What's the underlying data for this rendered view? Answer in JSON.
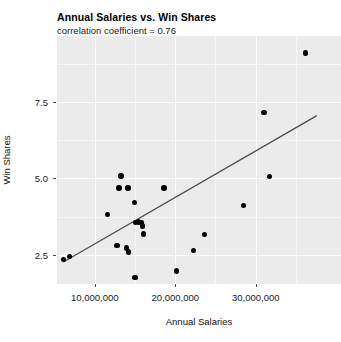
{
  "chart_data": {
    "type": "scatter",
    "title": "Annual Salaries vs. Win Shares",
    "subtitle": "correlation coefficient = 0.76",
    "xlabel": "Annual Salaries",
    "ylabel": "Win Shares",
    "xlim": [
      5300000,
      40600000
    ],
    "ylim": [
      1.55,
      9.65
    ],
    "grid": true,
    "legend": null,
    "xticks": [
      10000000,
      20000000,
      30000000
    ],
    "xtick_labels": [
      "10,000,000",
      "20,000,000",
      "30,000,000"
    ],
    "yticks": [
      2.5,
      5.0,
      7.5
    ],
    "ytick_labels": [
      "2.5",
      "5.0",
      "7.5"
    ],
    "x_minor_ticks": [
      5000000,
      15000000,
      25000000,
      35000000
    ],
    "y_minor_ticks": [
      3.75,
      6.25,
      8.75
    ],
    "point_color": "#000000",
    "panel_color": "#ebebeb",
    "grid_color": "#ffffff",
    "fit_line_color": "#4d4d4d",
    "fit_line": {
      "x_start": 6100000,
      "y_start": 2.27,
      "x_end": 37600000,
      "y_end": 7.05
    },
    "points": [
      {
        "x": 6100000,
        "y": 2.35
      },
      {
        "x": 6850000,
        "y": 2.45
      },
      {
        "x": 11550000,
        "y": 3.82
      },
      {
        "x": 12750000,
        "y": 2.8
      },
      {
        "x": 13900000,
        "y": 2.73
      },
      {
        "x": 13250000,
        "y": 5.08
      },
      {
        "x": 13000000,
        "y": 4.68
      },
      {
        "x": 14100000,
        "y": 4.68
      },
      {
        "x": 14950000,
        "y": 4.22
      },
      {
        "x": 15050000,
        "y": 3.55
      },
      {
        "x": 15450000,
        "y": 3.58
      },
      {
        "x": 15800000,
        "y": 3.56
      },
      {
        "x": 15950000,
        "y": 3.45
      },
      {
        "x": 14200000,
        "y": 2.6
      },
      {
        "x": 16050000,
        "y": 3.18
      },
      {
        "x": 15000000,
        "y": 1.76
      },
      {
        "x": 18600000,
        "y": 4.68
      },
      {
        "x": 20150000,
        "y": 1.98
      },
      {
        "x": 22250000,
        "y": 2.65
      },
      {
        "x": 23600000,
        "y": 3.16
      },
      {
        "x": 28500000,
        "y": 4.11
      },
      {
        "x": 31700000,
        "y": 5.07
      },
      {
        "x": 31050000,
        "y": 7.15
      },
      {
        "x": 36150000,
        "y": 9.1
      }
    ]
  }
}
